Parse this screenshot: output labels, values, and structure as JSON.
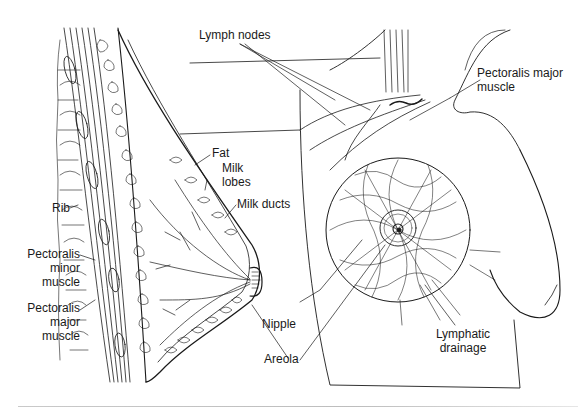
{
  "diagram": {
    "colors": {
      "ink": "#1a1a1a",
      "background": "#ffffff",
      "rule": "#c4c4c4"
    },
    "labels": {
      "lymph_nodes": [
        "Lymph nodes"
      ],
      "pectoralis_major_right": [
        "Pectoralis major",
        "muscle"
      ],
      "fat": [
        "Fat"
      ],
      "milk_lobes": [
        "Milk",
        "lobes"
      ],
      "milk_ducts": [
        "Milk ducts"
      ],
      "rib": [
        "Rib"
      ],
      "pectoralis_minor": [
        "Pectoralis",
        "minor",
        "muscle"
      ],
      "pectoralis_major_left": [
        "Pectoralis",
        "major",
        "muscle"
      ],
      "nipple": [
        "Nipple"
      ],
      "areola": [
        "Areola"
      ],
      "lymphatic_drainage": [
        "Lymphatic",
        "drainage"
      ]
    },
    "panels": [
      {
        "name": "sagittal-section",
        "description": "Side cross-section of breast on chest wall"
      },
      {
        "name": "frontal-view",
        "description": "Frontal view showing lymphatic network"
      }
    ]
  }
}
